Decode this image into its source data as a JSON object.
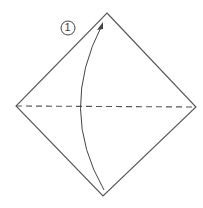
{
  "diagram": {
    "type": "origami-step",
    "step_number": "1",
    "step_label": "①",
    "shape": "square-diamond",
    "colors": {
      "line": "#555555",
      "background": "#ffffff"
    },
    "fold_line": {
      "style": "valley-dashed",
      "orientation": "horizontal"
    },
    "arrow": {
      "direction": "bottom-to-top",
      "description": "fold bottom corner up to top corner"
    }
  }
}
